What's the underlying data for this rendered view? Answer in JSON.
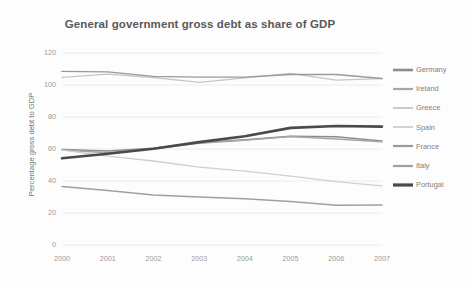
{
  "chart_data": {
    "type": "line",
    "title": "General government gross debt as share of GDP",
    "xlabel": "",
    "ylabel": "Percentage gross debt to GDP",
    "x": [
      "2000",
      "2001",
      "2002",
      "2003",
      "2004",
      "2005",
      "2006",
      "2007"
    ],
    "xtick_labels": [
      "2000",
      "2001",
      "2002",
      "2003",
      "2004",
      "2005",
      "2006",
      "2007"
    ],
    "ytick_labels": [
      "0",
      "20",
      "40",
      "60",
      "80",
      "100",
      "120"
    ],
    "yticks": [
      0,
      20,
      40,
      60,
      80,
      100,
      120
    ],
    "ylim": [
      0,
      120
    ],
    "grid": true,
    "legend_position": "right",
    "series": [
      {
        "name": "Germany",
        "color": "#8c8c8c",
        "width": 1.5,
        "values": [
          59.7,
          58.8,
          60.4,
          63.9,
          65.8,
          68.0,
          67.6,
          65.0
        ]
      },
      {
        "name": "Ireland",
        "color": "#a6a6a6",
        "width": 1.5,
        "values": [
          59.3,
          57.6,
          60.2,
          63.6,
          65.5,
          67.8,
          66.3,
          64.5
        ]
      },
      {
        "name": "Greece",
        "color": "#c6c6c6",
        "width": 1.3,
        "values": [
          104.8,
          106.8,
          104.7,
          101.6,
          104.4,
          107.2,
          103.1,
          104.0
        ]
      },
      {
        "name": "Spain",
        "color": "#cfcfcf",
        "width": 1.3,
        "values": [
          59.3,
          55.6,
          52.5,
          48.7,
          46.2,
          43.0,
          39.6,
          36.9
        ]
      },
      {
        "name": "France",
        "color": "#9a9a9a",
        "width": 1.4,
        "values": [
          108.5,
          108.2,
          105.4,
          104.9,
          104.9,
          106.6,
          106.6,
          104.1
        ]
      },
      {
        "name": "Italy",
        "color": "#a0a0a0",
        "width": 1.5,
        "values": [
          36.6,
          34.0,
          31.2,
          30.0,
          28.9,
          27.2,
          24.9,
          25.0
        ]
      },
      {
        "name": "Portugal",
        "color": "#4a4a4a",
        "width": 2.6,
        "values": [
          54.2,
          57.0,
          60.2,
          64.3,
          68.0,
          73.2,
          74.4,
          74.0
        ]
      }
    ]
  },
  "legend": {
    "items": [
      {
        "label": "Germany"
      },
      {
        "label": "Ireland"
      },
      {
        "label": "Greece"
      },
      {
        "label": "Spain"
      },
      {
        "label": "France"
      },
      {
        "label": "Italy"
      },
      {
        "label": "Portugal"
      }
    ]
  }
}
